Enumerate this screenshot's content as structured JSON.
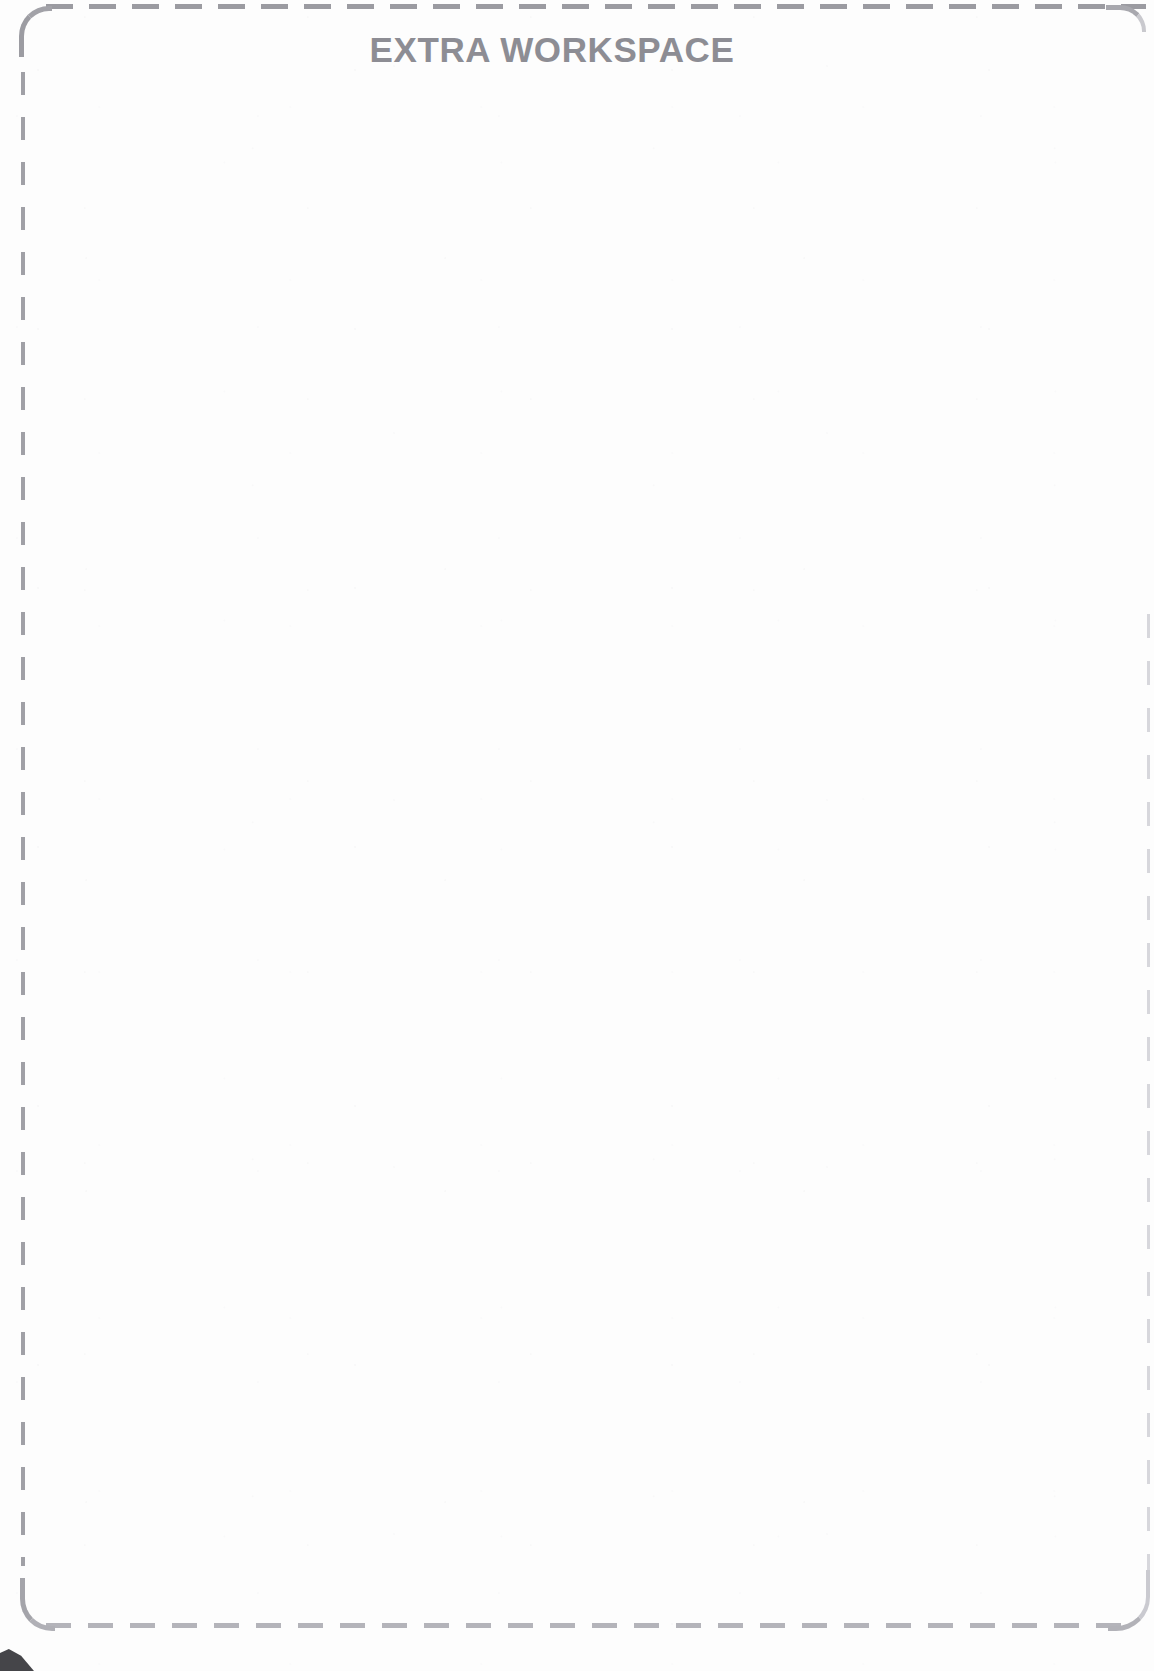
{
  "page": {
    "title": "EXTRA WORKSPACE",
    "background_color": "#fdfdfd",
    "width": 1154,
    "height": 1671
  },
  "workspace": {
    "heading": "EXTRA WORKSPACE",
    "heading_color": "#8d8d94",
    "content": "",
    "border_style": "dashed",
    "border_color": "#a0a0a6",
    "corner_style": "rounded"
  },
  "artifacts": {
    "scan_mark_label": "scan-artifact",
    "scan_mark_color": "#2c2c30"
  }
}
